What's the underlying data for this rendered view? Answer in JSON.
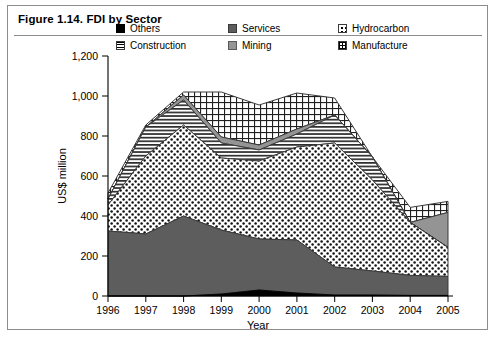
{
  "figure": {
    "title": "Figure 1.14. FDI by Sector"
  },
  "legend": {
    "items": [
      {
        "label": "Others",
        "key": "others",
        "swatch": "solid-black-swatch"
      },
      {
        "label": "Services",
        "key": "services",
        "swatch": "solid-dark-gray-swatch"
      },
      {
        "label": "Hydrocarbon",
        "key": "hydrocarbon",
        "swatch": "dotted-pattern-swatch"
      },
      {
        "label": "Construction",
        "key": "construction",
        "swatch": "horizontal-lines-swatch"
      },
      {
        "label": "Mining",
        "key": "mining",
        "swatch": "solid-gray-swatch"
      },
      {
        "label": "Manufacture",
        "key": "manufacture",
        "swatch": "grid-pattern-swatch"
      }
    ]
  },
  "axes": {
    "y_label": "US$ million",
    "x_label": "Year",
    "y_ticks": [
      "0",
      "200",
      "400",
      "600",
      "800",
      "1,000",
      "1,200"
    ],
    "x_ticks": [
      "1996",
      "1997",
      "1998",
      "1999",
      "2000",
      "2001",
      "2002",
      "2003",
      "2004",
      "2005"
    ]
  },
  "chart_data": {
    "type": "area",
    "title": "Figure 1.14. FDI by Sector",
    "xlabel": "Year",
    "ylabel": "US$ million",
    "ylim": [
      0,
      1200
    ],
    "ytick_step": 200,
    "grid": false,
    "legend_position": "top",
    "stacked": true,
    "categories": [
      "1996",
      "1997",
      "1998",
      "1999",
      "2000",
      "2001",
      "2002",
      "2003",
      "2004",
      "2005"
    ],
    "series": [
      {
        "name": "Others",
        "values": [
          0,
          0,
          0,
          10,
          30,
          15,
          5,
          5,
          3,
          3
        ]
      },
      {
        "name": "Services",
        "values": [
          325,
          310,
          400,
          320,
          255,
          265,
          140,
          120,
          100,
          95
        ]
      },
      {
        "name": "Hydrocarbon",
        "values": [
          130,
          390,
          455,
          360,
          390,
          465,
          620,
          455,
          265,
          145
        ]
      },
      {
        "name": "Construction",
        "values": [
          30,
          145,
          125,
          75,
          55,
          65,
          140,
          115,
          0,
          0
        ]
      },
      {
        "name": "Mining",
        "values": [
          0,
          0,
          25,
          30,
          25,
          25,
          0,
          0,
          0,
          175
        ]
      },
      {
        "name": "Manufacture",
        "values": [
          30,
          10,
          15,
          225,
          200,
          180,
          85,
          0,
          75,
          55
        ]
      }
    ],
    "stack_tops": {
      "Others": [
        0,
        0,
        0,
        10,
        30,
        15,
        5,
        5,
        3,
        3
      ],
      "Services": [
        325,
        310,
        400,
        330,
        285,
        280,
        145,
        125,
        103,
        98
      ],
      "Hydrocarbon": [
        455,
        700,
        855,
        690,
        675,
        745,
        765,
        580,
        368,
        243
      ],
      "Construction": [
        485,
        845,
        980,
        765,
        730,
        810,
        905,
        695,
        368,
        243
      ],
      "Mining": [
        485,
        845,
        1005,
        795,
        755,
        835,
        905,
        695,
        368,
        418
      ],
      "Manufacture": [
        515,
        855,
        1020,
        1020,
        955,
        1015,
        990,
        695,
        443,
        473
      ]
    }
  }
}
